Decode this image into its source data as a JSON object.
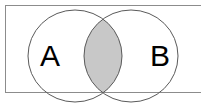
{
  "diagram": {
    "type": "venn",
    "sets": [
      {
        "id": "A",
        "label": "A"
      },
      {
        "id": "B",
        "label": "B"
      }
    ],
    "highlighted_region": "A ∩ B",
    "colors": {
      "background": "#ffffff",
      "frame": "#8c8c8c",
      "circle_stroke": "#5a5a5a",
      "intersection_fill": "#c8c8c8",
      "label": "#000000"
    }
  }
}
